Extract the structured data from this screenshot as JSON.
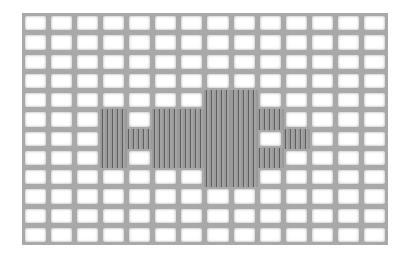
{
  "image": {
    "subject": "Filet crochet mesh with solid block motif",
    "thread_color": "#a9a9a9",
    "stitch_shadow_color": "#5e5e5e",
    "background_color": "#ffffff",
    "grid": {
      "columns": 14,
      "rows": 12,
      "solid_cells": [
        [
          7,
          4
        ],
        [
          8,
          4
        ],
        [
          3,
          5
        ],
        [
          5,
          5
        ],
        [
          6,
          5
        ],
        [
          7,
          5
        ],
        [
          8,
          5
        ],
        [
          9,
          5
        ],
        [
          3,
          6
        ],
        [
          4,
          6
        ],
        [
          5,
          6
        ],
        [
          6,
          6
        ],
        [
          7,
          6
        ],
        [
          8,
          6
        ],
        [
          10,
          6
        ],
        [
          3,
          7
        ],
        [
          5,
          7
        ],
        [
          6,
          7
        ],
        [
          7,
          7
        ],
        [
          8,
          7
        ],
        [
          9,
          7
        ],
        [
          7,
          8
        ],
        [
          8,
          8
        ]
      ]
    }
  }
}
